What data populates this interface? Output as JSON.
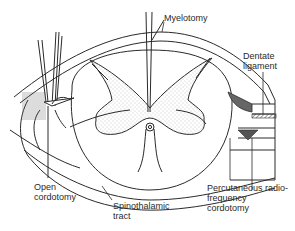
{
  "diagram": {
    "labels": {
      "myelotomy": "Myelotomy",
      "dentate_ligament_1": "Dentate",
      "dentate_ligament_2": "ligament",
      "open_cordotomy_1": "Open",
      "open_cordotomy_2": "cordotomy",
      "spinothalamic_1": "Spinothalamic",
      "spinothalamic_2": "tract",
      "percutaneous_1": "Percutaneous radio-",
      "percutaneous_2": "frequency",
      "percutaneous_3": "cordotomy"
    },
    "colors": {
      "line": "#2a2a2a",
      "grey_matter_stipple": "#9a9a9a",
      "shaded": "#555555"
    }
  }
}
